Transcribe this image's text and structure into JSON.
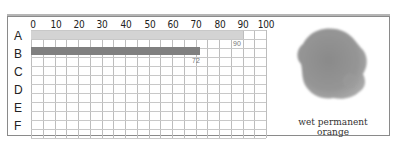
{
  "chart_data": {
    "type": "bar",
    "orientation": "horizontal",
    "title": "",
    "xlabel": "",
    "ylabel": "",
    "categories": [
      "A",
      "B",
      "C",
      "D",
      "E",
      "F"
    ],
    "values": [
      90,
      72,
      null,
      null,
      null,
      null
    ],
    "value_labels": [
      "90",
      "72",
      "",
      "",
      "",
      ""
    ],
    "bar_colors": [
      "#d3d3d3",
      "#808080"
    ],
    "x_ticks": [
      "0",
      "10",
      "20",
      "30",
      "40",
      "50",
      "60",
      "70",
      "80",
      "90",
      "100"
    ],
    "xlim": [
      0,
      100
    ],
    "grid": true,
    "legend": null
  },
  "swatch": {
    "caption": "wet permanent orange",
    "color": "#8c8c8c"
  }
}
